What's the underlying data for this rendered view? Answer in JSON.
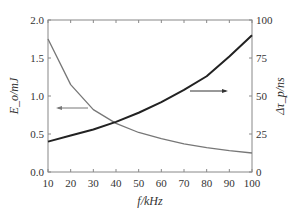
{
  "chart_data": {
    "type": "line",
    "title": "",
    "xlabel": "f/kHz",
    "ylabel_left": "E_o/mJ",
    "ylabel_right": "Δτ_p/ns",
    "xlim": [
      10,
      100
    ],
    "ylim_left": [
      0.0,
      2.0
    ],
    "ylim_right": [
      0,
      100
    ],
    "x_ticks": [
      "10",
      "20",
      "30",
      "40",
      "50",
      "60",
      "70",
      "80",
      "90",
      "100"
    ],
    "y_ticks_left": [
      "0.0",
      "0.5",
      "1.0",
      "1.5",
      "2.0"
    ],
    "y_ticks_right": [
      "0",
      "25",
      "50",
      "75",
      "100"
    ],
    "grid": false,
    "x": [
      10,
      20,
      30,
      40,
      50,
      60,
      70,
      80,
      90,
      100
    ],
    "series": [
      {
        "name": "E_o",
        "axis": "left",
        "color": "#777777",
        "values": [
          1.75,
          1.15,
          0.82,
          0.64,
          0.52,
          0.44,
          0.37,
          0.32,
          0.28,
          0.25
        ]
      },
      {
        "name": "Δτ_p",
        "axis": "right",
        "color": "#222222",
        "values": [
          20,
          24,
          28,
          33,
          39,
          46,
          54,
          63,
          76,
          90
        ]
      }
    ],
    "annotations": [
      {
        "type": "arrow",
        "direction": "left",
        "target_axis": "left",
        "label": "E_o arrow"
      },
      {
        "type": "arrow",
        "direction": "right",
        "target_axis": "right",
        "label": "Δτ_p arrow"
      }
    ]
  }
}
